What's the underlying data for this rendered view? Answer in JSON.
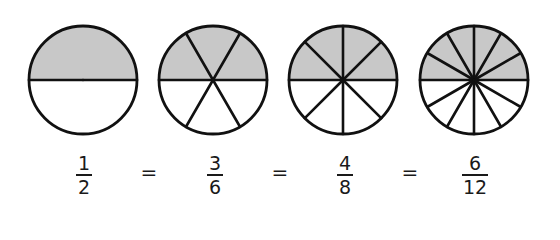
{
  "colors": {
    "shade": "#c8c8c8",
    "stroke": "#111111",
    "background": "#ffffff"
  },
  "circles": [
    {
      "id": "half",
      "center_x": 83,
      "center_y": 80,
      "radius": 54,
      "parts": 2,
      "shaded": 1
    },
    {
      "id": "sixths",
      "center_x": 213,
      "center_y": 80,
      "radius": 54,
      "parts": 6,
      "shaded": 3
    },
    {
      "id": "eighths",
      "center_x": 343,
      "center_y": 80,
      "radius": 54,
      "parts": 8,
      "shaded": 4
    },
    {
      "id": "twelfths",
      "center_x": 474,
      "center_y": 80,
      "radius": 54,
      "parts": 12,
      "shaded": 6
    }
  ],
  "fractions": [
    {
      "numerator": "1",
      "denominator": "2",
      "center_x": 84
    },
    {
      "numerator": "3",
      "denominator": "6",
      "center_x": 215
    },
    {
      "numerator": "4",
      "denominator": "8",
      "center_x": 345
    },
    {
      "numerator": "6",
      "denominator": "12",
      "center_x": 475
    }
  ],
  "equals": [
    {
      "symbol": "=",
      "center_x": 149
    },
    {
      "symbol": "=",
      "center_x": 280
    },
    {
      "symbol": "=",
      "center_x": 410
    }
  ]
}
